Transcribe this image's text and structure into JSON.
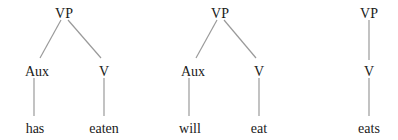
{
  "diagram": {
    "type": "syntax-trees",
    "trees": [
      {
        "name": "tree-has-eaten",
        "nodes": {
          "root": {
            "label": "VP",
            "x": 64,
            "y": 13
          },
          "aux": {
            "label": "Aux",
            "x": 37,
            "y": 71
          },
          "v": {
            "label": "V",
            "x": 104,
            "y": 71
          },
          "aux_leaf": {
            "label": "has",
            "x": 37,
            "y": 128
          },
          "v_leaf": {
            "label": "eaten",
            "x": 104,
            "y": 128
          }
        }
      },
      {
        "name": "tree-will-eat",
        "nodes": {
          "root": {
            "label": "VP",
            "x": 220,
            "y": 13
          },
          "aux": {
            "label": "Aux",
            "x": 193,
            "y": 71
          },
          "v": {
            "label": "V",
            "x": 259,
            "y": 71
          },
          "aux_leaf": {
            "label": "will",
            "x": 193,
            "y": 128
          },
          "v_leaf": {
            "label": "eat",
            "x": 259,
            "y": 128
          }
        }
      },
      {
        "name": "tree-eats",
        "nodes": {
          "root": {
            "label": "VP",
            "x": 369,
            "y": 13
          },
          "v": {
            "label": "V",
            "x": 369,
            "y": 71
          },
          "v_leaf": {
            "label": "eats",
            "x": 369,
            "y": 128
          }
        }
      }
    ],
    "colors": {
      "edge": "#9a9a9a",
      "text": "#1a1a1a",
      "background": "#ffffff"
    }
  }
}
